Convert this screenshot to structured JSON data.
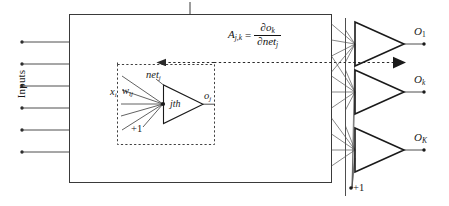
{
  "diagram": {
    "type": "neural-network-schematic",
    "inputs_label": "Inputs",
    "input_arrow_count": 6,
    "colors": {
      "line": "#3a3a3a",
      "dashed": "#2b2b2b",
      "text": "#1a1a1a",
      "background": "#ffffff"
    },
    "equation": {
      "lhs": "A",
      "lhs_sub": "j,k",
      "equals": "=",
      "numerator": "∂o",
      "numerator_sub": "k",
      "denominator": "∂net",
      "denominator_sub": "j"
    },
    "inner_box": {
      "caption": "jth neuron detail",
      "input_signal": "x",
      "input_signal_sub": "i",
      "weight": "w",
      "weight_sub": "ij",
      "bias": "+1",
      "net_label": "net",
      "net_sub": "j",
      "neuron_label": "jth",
      "output": "o",
      "output_sub": "j"
    },
    "outputs": [
      {
        "label": "O",
        "sub": "1"
      },
      {
        "label": "O",
        "sub": "k"
      },
      {
        "label": "O",
        "sub": "K"
      }
    ],
    "output_bias": "+1"
  }
}
